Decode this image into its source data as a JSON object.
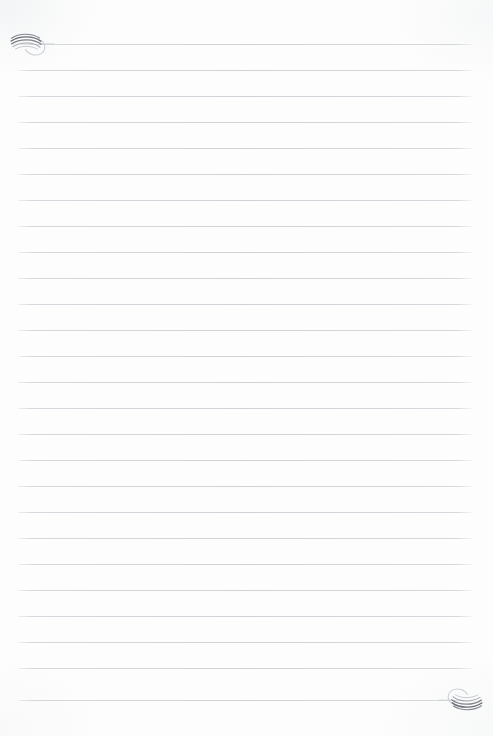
{
  "document": {
    "type": "lined-notepaper",
    "title": "Lined Note Paper",
    "page_width": 493,
    "page_height": 736,
    "background_color": "#fdfdfd",
    "content_text": ""
  },
  "ruling": {
    "line_count": 26,
    "first_line_y": 44,
    "line_spacing": 26,
    "line_start_x": 18,
    "line_end_x": 472,
    "line_thickness": 1,
    "line_color": "#ced2d7",
    "line_color_faded": "#dcdfe3",
    "lines_y": [
      44,
      70,
      96,
      122,
      148,
      174,
      200,
      226,
      252,
      278,
      304,
      330,
      356,
      382,
      408,
      434,
      460,
      486,
      512,
      538,
      564,
      590,
      616,
      642,
      668,
      700
    ]
  },
  "ornaments": {
    "top_left": {
      "name": "spiral-flourish",
      "position": "top-left",
      "anchor_line_index": 0,
      "stroke_color": "#6b7078",
      "accent_color": "#b9bdc3",
      "x": 8,
      "y": 28,
      "width": 46,
      "height": 32,
      "rotation": 0
    },
    "bottom_right": {
      "name": "spiral-flourish",
      "position": "bottom-right",
      "anchor_line_index": 25,
      "stroke_color": "#6b7078",
      "accent_color": "#b9bdc3",
      "x": 439,
      "y": 684,
      "width": 46,
      "height": 32,
      "rotation": 180
    }
  }
}
